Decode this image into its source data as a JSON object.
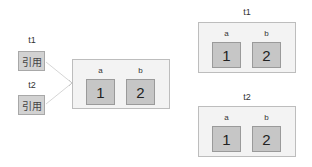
{
  "left": {
    "refs": [
      {
        "var": "t1",
        "label": "引用"
      },
      {
        "var": "t2",
        "label": "引用"
      }
    ],
    "shared_object": {
      "keys": [
        "a",
        "b"
      ],
      "values": [
        "1",
        "2"
      ]
    }
  },
  "right": {
    "objects": [
      {
        "var": "t1",
        "keys": [
          "a",
          "b"
        ],
        "values": [
          "1",
          "2"
        ]
      },
      {
        "var": "t2",
        "keys": [
          "a",
          "b"
        ],
        "values": [
          "1",
          "2"
        ]
      }
    ]
  },
  "colors": {
    "container_fill": "#f3f3f3",
    "container_border": "#bdbdbd",
    "cell_fill": "#c6c6c6",
    "cell_border": "#9a9a9a",
    "ref_fill": "#d2d2d2",
    "link_line": "#d8d8d8"
  }
}
